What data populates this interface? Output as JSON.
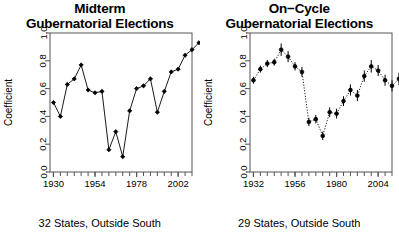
{
  "figure": {
    "y_axis_label": "Coefficient",
    "y_ticks": [
      "0.0",
      "0.2",
      "0.4",
      "0.6",
      "0.8",
      "1.0"
    ],
    "point_color": "#000000",
    "line_color": "#000000",
    "axis_color": "#555555"
  },
  "panels": [
    {
      "title_line1": "Midterm",
      "title_line2": "Gubernatorial Elections",
      "caption": "32 States, Outside South",
      "x_tick_labels": [
        "1930",
        "1954",
        "1978",
        "2002"
      ]
    },
    {
      "title_line1": "On−Cycle",
      "title_line2": "Gubernatorial Elections",
      "caption": "29 States, Outside South",
      "x_tick_labels": [
        "1932",
        "1956",
        "1980",
        "2004"
      ]
    }
  ],
  "chart_data": [
    {
      "type": "line",
      "title": "Midterm Gubernatorial Elections",
      "subtitle": "32 States, Outside South",
      "xlabel": "",
      "ylabel": "Coefficient",
      "ylim": [
        0.0,
        1.0
      ],
      "xlim": [
        1928,
        2010
      ],
      "grid": false,
      "legend": "none",
      "x_tick_labels": [
        "1930",
        "1954",
        "1978",
        "2002"
      ],
      "x_tick_values": [
        1930,
        1954,
        1978,
        2002
      ],
      "y_tick_values": [
        0.0,
        0.2,
        0.4,
        0.6,
        0.8,
        1.0
      ],
      "minor_ticks_every": 4,
      "has_error_bars": false,
      "line_style": "solid",
      "marker": "diamond",
      "x": [
        1930,
        1934,
        1938,
        1942,
        1946,
        1950,
        1954,
        1958,
        1962,
        1966,
        1970,
        1974,
        1978,
        1982,
        1986,
        1990,
        1994,
        1998,
        2002,
        2006
      ],
      "y": [
        0.5,
        0.4,
        0.63,
        0.67,
        0.77,
        0.59,
        0.57,
        0.58,
        0.16,
        0.29,
        0.11,
        0.44,
        0.6,
        0.62,
        0.67,
        0.43,
        0.58,
        0.72,
        0.74,
        0.84
      ],
      "series": [
        {
          "name": "Coefficient",
          "values": [
            0.5,
            0.4,
            0.63,
            0.67,
            0.77,
            0.59,
            0.57,
            0.58,
            0.16,
            0.29,
            0.11,
            0.44,
            0.6,
            0.62,
            0.67,
            0.43,
            0.58,
            0.72,
            0.74,
            0.84
          ]
        }
      ],
      "extra_points": {
        "x": [
          2010,
          2014
        ],
        "y": [
          0.88,
          0.93
        ]
      }
    },
    {
      "type": "line",
      "title": "On−Cycle Gubernatorial Elections",
      "subtitle": "29 States, Outside South",
      "xlabel": "",
      "ylabel": "Coefficient",
      "ylim": [
        0.0,
        1.0
      ],
      "xlim": [
        1930,
        2012
      ],
      "grid": false,
      "legend": "none",
      "x_tick_labels": [
        "1932",
        "1956",
        "1980",
        "2004"
      ],
      "x_tick_values": [
        1932,
        1956,
        1980,
        2004
      ],
      "y_tick_values": [
        0.0,
        0.2,
        0.4,
        0.6,
        0.8,
        1.0
      ],
      "minor_ticks_every": 4,
      "has_error_bars": true,
      "line_style": "dotted",
      "marker": "circle",
      "x": [
        1932,
        1936,
        1940,
        1944,
        1948,
        1952,
        1956,
        1960,
        1964,
        1968,
        1972,
        1976,
        1980,
        1984,
        1988,
        1992,
        1996,
        2000,
        2004,
        2008,
        2012
      ],
      "y": [
        0.66,
        0.74,
        0.78,
        0.79,
        0.88,
        0.83,
        0.76,
        0.72,
        0.36,
        0.38,
        0.26,
        0.43,
        0.42,
        0.51,
        0.59,
        0.55,
        0.69,
        0.76,
        0.73,
        0.66,
        0.62
      ],
      "y_err": [
        0.025,
        0.025,
        0.025,
        0.025,
        0.045,
        0.04,
        0.03,
        0.035,
        0.03,
        0.03,
        0.03,
        0.035,
        0.035,
        0.035,
        0.04,
        0.04,
        0.04,
        0.045,
        0.04,
        0.04,
        0.04
      ],
      "series": [
        {
          "name": "Coefficient",
          "values": [
            0.66,
            0.74,
            0.78,
            0.79,
            0.88,
            0.83,
            0.76,
            0.72,
            0.36,
            0.38,
            0.26,
            0.43,
            0.42,
            0.51,
            0.59,
            0.55,
            0.69,
            0.76,
            0.73,
            0.66,
            0.62
          ]
        }
      ],
      "extra_points": {
        "x": [
          2016
        ],
        "y": [
          0.67
        ],
        "y_err": [
          0.045
        ]
      }
    }
  ]
}
